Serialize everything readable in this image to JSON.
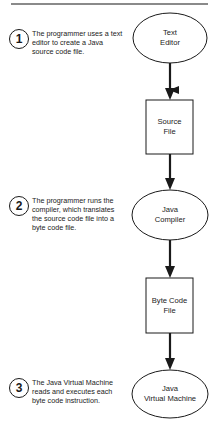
{
  "diagram": {
    "title_rule": true,
    "steps": [
      {
        "number": "1",
        "text": "The programmer uses a text editor to create a Java source code file."
      },
      {
        "number": "2",
        "text": "The programmer runs the compiler, which translates the source code file into a byte code file."
      },
      {
        "number": "3",
        "text": "The Java Virtual Machine reads and executes each byte code instruction."
      }
    ],
    "nodes": [
      {
        "shape": "ellipse",
        "label_line1": "Text",
        "label_line2": "Editor"
      },
      {
        "shape": "rectangle",
        "label_line1": "Source",
        "label_line2": "File"
      },
      {
        "shape": "ellipse",
        "label_line1": "Java",
        "label_line2": "Compiler"
      },
      {
        "shape": "rectangle",
        "label_line1": "Byte Code",
        "label_line2": "File"
      },
      {
        "shape": "ellipse",
        "label_line1": "Java",
        "label_line2": "Virtual Machine"
      }
    ],
    "edges": [
      {
        "from": "Text Editor",
        "to": "Source File"
      },
      {
        "from": "Source File",
        "to": "Java Compiler"
      },
      {
        "from": "Java Compiler",
        "to": "Byte Code File"
      },
      {
        "from": "Byte Code File",
        "to": "Java Virtual Machine"
      }
    ],
    "colors": {
      "stroke": "#1a1a1a",
      "rule": "#8a8a8a",
      "background": "#ffffff"
    }
  }
}
